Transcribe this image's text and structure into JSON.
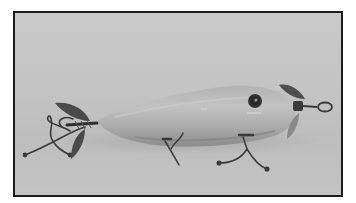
{
  "image": {
    "alt": "Vintage wooden fishing lure with front and rear propeller spinners, two belly treble hooks and a tail treble hook, photographed on a plain gray background",
    "subject": "fishing-lure",
    "style": "grayscale photograph with dark border frame"
  },
  "colors": {
    "page_background": "#ffffff",
    "frame_border": "#1c1c1c",
    "backdrop": "#c4c4c4",
    "lure_body_light": "#bdbdbd",
    "lure_body_shadow": "#8a8a8a",
    "eye": "#2a2a2a",
    "metal_hardware": "#3a3a3a"
  }
}
